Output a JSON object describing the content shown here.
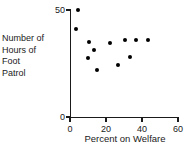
{
  "chart_data": {
    "type": "scatter",
    "title": "",
    "xlabel": "Percent on Welfare",
    "ylabel": "Number of Hours of Foot Patrol",
    "ylabel_lines": [
      "Number of",
      "Hours of",
      "Foot",
      "Patrol"
    ],
    "xlim": [
      0,
      60
    ],
    "ylim": [
      0,
      50
    ],
    "xticks": [
      0,
      20,
      40,
      60
    ],
    "xtick_labels": [
      "0",
      "20",
      "40",
      "60"
    ],
    "yticks": [
      0,
      50
    ],
    "ytick_labels": [
      "0",
      "50"
    ],
    "grid": false,
    "legend": null,
    "marker": "filled-circle",
    "marker_color": "#000000",
    "axis_color": "#1a1a1a",
    "points": [
      {
        "x": 4.4,
        "y": 50.0
      },
      {
        "x": 3.3,
        "y": 41.0
      },
      {
        "x": 10.6,
        "y": 35.0
      },
      {
        "x": 13.3,
        "y": 31.5
      },
      {
        "x": 10.0,
        "y": 27.8
      },
      {
        "x": 15.0,
        "y": 22.0
      },
      {
        "x": 22.0,
        "y": 34.4
      },
      {
        "x": 26.7,
        "y": 24.5
      },
      {
        "x": 30.6,
        "y": 35.8
      },
      {
        "x": 33.3,
        "y": 28.0
      },
      {
        "x": 36.7,
        "y": 35.8
      },
      {
        "x": 43.3,
        "y": 35.8
      }
    ]
  }
}
